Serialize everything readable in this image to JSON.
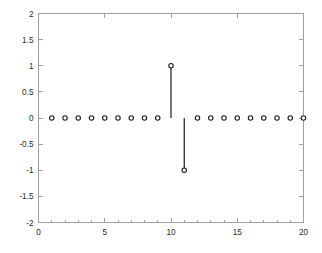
{
  "chart_data": {
    "type": "line",
    "plot_style": "stem",
    "title": "",
    "subtitle": "",
    "xlabel": "",
    "ylabel": "",
    "xlim": [
      0,
      20
    ],
    "ylim": [
      -2,
      2
    ],
    "grid": false,
    "legend": null,
    "legend_position": "none",
    "x_ticks": [
      0,
      5,
      10,
      15,
      20
    ],
    "x_tick_labels": [
      "0",
      "5",
      "10",
      "15",
      "20"
    ],
    "y_ticks": [
      -2,
      -1.5,
      -1,
      -0.5,
      0,
      0.5,
      1,
      1.5,
      2
    ],
    "y_tick_labels": [
      "-2",
      "-1.5",
      "-1",
      "-0.5",
      "0",
      "0.5",
      "1",
      "1.5",
      "2"
    ],
    "x_minor_ticks": [
      1,
      2,
      3,
      4,
      6,
      7,
      8,
      9,
      11,
      12,
      13,
      14,
      16,
      17,
      18,
      19
    ],
    "x": [
      1,
      2,
      3,
      4,
      5,
      6,
      7,
      8,
      9,
      10,
      11,
      12,
      13,
      14,
      15,
      16,
      17,
      18,
      19,
      20
    ],
    "values": [
      0,
      0,
      0,
      0,
      0,
      0,
      0,
      0,
      0,
      1,
      -1,
      0,
      0,
      0,
      0,
      0,
      0,
      0,
      0,
      0
    ],
    "marker": "open-circle",
    "marker_color": "#1a1a1a",
    "line_color": "#1a1a1a",
    "axis_color": "#a0a0a0",
    "background_color": "#ffffff"
  },
  "figure": {
    "background_color": "#ffffff",
    "axes_border_color": "#a0a0a0"
  }
}
